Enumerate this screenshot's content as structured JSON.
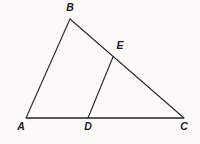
{
  "figure": {
    "kind": "geometry-diagram",
    "shape": "triangle-with-cevian",
    "canvas": {
      "width": 200,
      "height": 144
    },
    "background_color": "#fbfaf9",
    "line_color": "#2b2b2b",
    "label_color": "#202020",
    "points": [
      {
        "id": "A",
        "label": "A",
        "x": 26,
        "y": 118,
        "label_x": 21,
        "label_y": 130
      },
      {
        "id": "B",
        "label": "B",
        "x": 70,
        "y": 19,
        "label_x": 70,
        "label_y": 11
      },
      {
        "id": "C",
        "label": "C",
        "x": 184,
        "y": 118,
        "label_x": 184,
        "label_y": 130
      },
      {
        "id": "D",
        "label": "D",
        "x": 88,
        "y": 118,
        "label_x": 88,
        "label_y": 130
      },
      {
        "id": "E",
        "label": "E",
        "x": 113,
        "y": 57,
        "label_x": 120,
        "label_y": 49
      }
    ],
    "segments": [
      {
        "id": "AB",
        "from": "A",
        "to": "B",
        "style": "normal"
      },
      {
        "id": "BC",
        "from": "B",
        "to": "C",
        "style": "normal"
      },
      {
        "id": "AC",
        "from": "A",
        "to": "C",
        "style": "baseline"
      },
      {
        "id": "DE",
        "from": "D",
        "to": "E",
        "style": "normal"
      }
    ],
    "specks": [
      {
        "x": 8,
        "y": 14,
        "size": 1.2
      },
      {
        "x": 151,
        "y": 9,
        "size": 1.4
      },
      {
        "x": 178,
        "y": 33,
        "size": 1.1
      },
      {
        "x": 44,
        "y": 97,
        "size": 1.0
      },
      {
        "x": 96,
        "y": 88,
        "size": 1.2
      },
      {
        "x": 12,
        "y": 136,
        "size": 1.3
      },
      {
        "x": 63,
        "y": 139,
        "size": 1.0
      },
      {
        "x": 136,
        "y": 131,
        "size": 1.2
      },
      {
        "x": 191,
        "y": 101,
        "size": 1.1
      },
      {
        "x": 29,
        "y": 54,
        "size": 1.0
      },
      {
        "x": 120,
        "y": 20,
        "size": 1.1
      },
      {
        "x": 168,
        "y": 75,
        "size": 1.0
      }
    ]
  }
}
